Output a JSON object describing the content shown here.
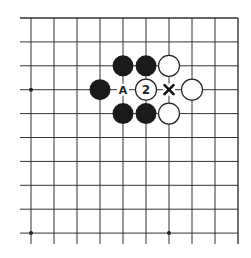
{
  "diagram": {
    "type": "go-board-fragment",
    "grid": {
      "columns": 10,
      "rows": 10,
      "x_start": 31,
      "y_start": 18,
      "spacing_x": 23.0,
      "spacing_y": 23.9,
      "line_color": "#333333",
      "edges": {
        "top": true,
        "right": true,
        "left": false,
        "bottom": false
      }
    },
    "star_points": [
      {
        "col": 0,
        "row": 3
      },
      {
        "col": 0,
        "row": 9
      },
      {
        "col": 6,
        "row": 9
      }
    ],
    "stones": [
      {
        "color": "black",
        "col": 4,
        "row": 2
      },
      {
        "color": "black",
        "col": 5,
        "row": 2
      },
      {
        "color": "white",
        "col": 6,
        "row": 2
      },
      {
        "color": "black",
        "col": 3,
        "row": 3
      },
      {
        "color": "white",
        "col": 5,
        "row": 3,
        "label": "2"
      },
      {
        "color": "white",
        "col": 7,
        "row": 3
      },
      {
        "color": "black",
        "col": 4,
        "row": 4
      },
      {
        "color": "black",
        "col": 5,
        "row": 4
      },
      {
        "color": "white",
        "col": 6,
        "row": 4
      }
    ],
    "marks": [
      {
        "type": "letter",
        "text": "A",
        "col": 4,
        "row": 3
      },
      {
        "type": "cross",
        "text": "X",
        "col": 6,
        "row": 3
      }
    ],
    "colors": {
      "black_stone": "#1a1a1a",
      "white_stone_fill": "#ffffff",
      "white_stone_stroke": "#222222"
    }
  }
}
